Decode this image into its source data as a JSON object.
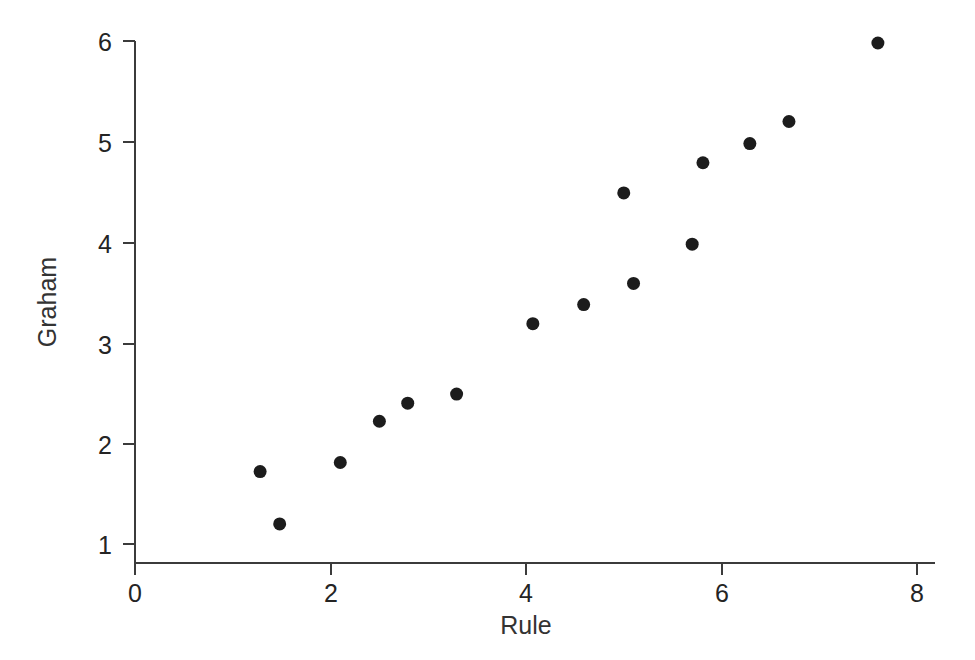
{
  "chart_data": {
    "type": "scatter",
    "title": "",
    "xlabel": "Rule",
    "ylabel": "Graham",
    "xlim": [
      0,
      8
    ],
    "ylim": [
      1,
      6
    ],
    "xticks": [
      0,
      2,
      4,
      6,
      8
    ],
    "yticks": [
      1,
      2,
      3,
      4,
      5,
      6
    ],
    "xtick_labels": [
      "0",
      "2",
      "4",
      "6",
      "8"
    ],
    "ytick_labels": [
      "1",
      "2",
      "3",
      "4",
      "5",
      "6"
    ],
    "grid": false,
    "legend": null,
    "marker": {
      "shape": "circle",
      "color": "#1c1c1c",
      "size_px": 13
    },
    "background_color": "#ffffff",
    "axis_color": "#3b3b3b",
    "n_points": 16,
    "points": [
      {
        "x": 1.28,
        "y": 1.72
      },
      {
        "x": 1.48,
        "y": 1.2
      },
      {
        "x": 2.1,
        "y": 1.81
      },
      {
        "x": 2.5,
        "y": 2.22
      },
      {
        "x": 2.79,
        "y": 2.4
      },
      {
        "x": 3.29,
        "y": 2.49
      },
      {
        "x": 4.07,
        "y": 3.19
      },
      {
        "x": 4.59,
        "y": 3.38
      },
      {
        "x": 5.0,
        "y": 4.49
      },
      {
        "x": 5.1,
        "y": 3.59
      },
      {
        "x": 5.7,
        "y": 3.98
      },
      {
        "x": 5.81,
        "y": 4.79
      },
      {
        "x": 6.29,
        "y": 4.98
      },
      {
        "x": 6.69,
        "y": 5.2
      },
      {
        "x": 7.6,
        "y": 5.98
      }
    ],
    "series": [
      {
        "name": "Graham vs Rule",
        "x": [
          1.28,
          1.48,
          2.1,
          2.5,
          2.79,
          3.29,
          4.07,
          4.59,
          5.0,
          5.1,
          5.7,
          5.81,
          6.29,
          6.69,
          7.6
        ],
        "y": [
          1.72,
          1.2,
          1.81,
          2.22,
          2.4,
          2.49,
          3.19,
          3.38,
          4.49,
          3.59,
          3.98,
          4.79,
          4.98,
          5.2,
          5.98
        ]
      }
    ]
  },
  "axes": {
    "x_axis_name": "Rule",
    "y_axis_name": "Graham"
  }
}
